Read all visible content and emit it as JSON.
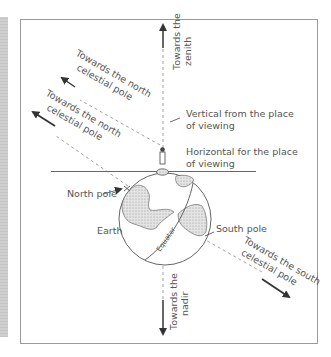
{
  "diagram": {
    "labels": {
      "zenith": [
        "Towards",
        "the",
        "zenith"
      ],
      "zenith_line1": "Towards  the",
      "zenith_line2": "zenith",
      "celestial_north_upper_1": "Towards the north",
      "celestial_north_upper_2": "celestial pole",
      "celestial_north_lower_1": "Towards the north",
      "celestial_north_lower_2": "celestial pole",
      "vertical_1": "Vertical from the place",
      "vertical_2": "of viewing",
      "horizontal_1": "Horizontal for the place",
      "horizontal_2": "of viewing",
      "north_pole": "North pole",
      "earth": "Earth",
      "equator": "Equator",
      "south_pole": "South pole",
      "celestial_south_1": "Towards the south",
      "celestial_south_2": "celestial pole",
      "nadir_1": "Towards the",
      "nadir_2": "nadir"
    },
    "colors": {
      "line": "#444444",
      "dashed": "#8a8a8a",
      "frame": "#9a9a9a",
      "land": "#d9d9d9",
      "text": "#555555"
    }
  }
}
